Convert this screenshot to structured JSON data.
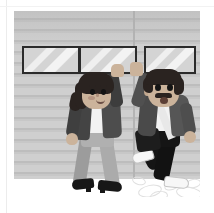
{
  "scene": {
    "title": "Two friends high-fiving on a sidewalk",
    "description": "Flat vector illustration of a woman and a bearded man giving each other a high five in front of a gray horizontally-sided storefront wall with three dark-framed windows.",
    "style": "flat-vector-illustration",
    "mood": "celebratory",
    "canvas": {
      "width": 214,
      "height": 213
    },
    "panel": {
      "left": 14,
      "top": 11,
      "width": 186,
      "height": 186
    }
  },
  "palette": {
    "page_background": "#ffffff",
    "card_border": "#ececec",
    "wall_base": "#c9c9c9",
    "wall_siding_light": "#cfcfcf",
    "wall_siding_dark": "#bdbdbd",
    "wall_seam": "#b4b4b4",
    "ground": "#ffffff",
    "window_frame": "#2b2b2b",
    "window_glass": "#dadada",
    "window_shine": "#f3f3f3",
    "skin": "#cbb39b",
    "hair": "#2a2320",
    "jacket_dark": "#4a4a4a",
    "jacket_light": "#6e6e6e",
    "shirt": "#f2f2f2",
    "pants_light": "#a6a6a6",
    "pants_dark": "#161616",
    "shoe_dark": "#171717",
    "shoe_light": "#f5f5f5",
    "bag_dark": "#1d1d1d",
    "strap_light": "#ececec",
    "scuff_line": "#e0e0e0"
  },
  "background": {
    "wall": {
      "name": "horizontal-siding-wall",
      "siding_stripe_height_px": 11,
      "seam_x_px": 119
    },
    "ground": {
      "name": "sidewalk",
      "color": "#ffffff"
    },
    "windows": [
      {
        "id": "window-left",
        "left": 8,
        "top": 35,
        "width": 58,
        "height": 28,
        "shine": "diagonal-double-stripe"
      },
      {
        "id": "window-center",
        "left": 65,
        "top": 35,
        "width": 58,
        "height": 28,
        "shine": "diagonal-double-stripe"
      },
      {
        "id": "window-right",
        "left": 130,
        "top": 35,
        "width": 52,
        "height": 28,
        "shine": "diagonal-double-stripe"
      }
    ]
  },
  "characters": [
    {
      "id": "woman",
      "role": "left-figure",
      "label": "Woman with ponytail",
      "hair": "dark ponytail",
      "facial_hair": "none",
      "expression": "smiling",
      "top": "dark gray blazer over white top",
      "accessory": "light crossbody sash strap",
      "bottom": "light gray trousers",
      "shoes": "black heeled shoes",
      "pose": "right arm raised for high five, walking"
    },
    {
      "id": "man",
      "role": "right-figure",
      "label": "Bearded man",
      "hair": "dark short hair",
      "facial_hair": "mustache and goatee",
      "expression": "open-mouthed surprise",
      "top": "gray jacket over white shirt",
      "accessory": "dark messenger bag with light strap",
      "bottom": "black trousers",
      "shoes": "white sneakers",
      "pose": "left arm raised for high five, mid-stride"
    }
  ],
  "effects": {
    "high_five": {
      "label": "high-five contact",
      "x": 118,
      "y": 62
    },
    "motion_scuffs": {
      "label": "motion scuff marks",
      "count": 6
    }
  }
}
